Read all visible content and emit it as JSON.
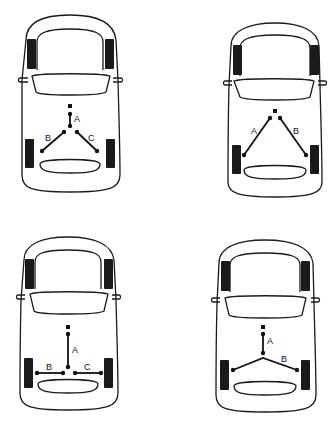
{
  "diagram": {
    "title": "",
    "colors": {
      "line": "#1a1a1a",
      "background": "#ffffff"
    },
    "cars": [
      {
        "id": "car-1",
        "position": "top-left",
        "layout": "Y-split: lever to three-way split, two diagonal cables to rear wheels",
        "labels": {
          "a": "A",
          "b": "B",
          "c": "C"
        }
      },
      {
        "id": "car-2",
        "position": "top-right",
        "layout": "V-split: two diagonal cables from lever to rear wheels",
        "labels": {
          "a": "A",
          "b": "B"
        }
      },
      {
        "id": "car-3",
        "position": "bottom-left",
        "layout": "T-split: vertical cable to equalizer, two horizontal cables to rear wheels",
        "labels": {
          "a": "A",
          "b": "B",
          "c": "C"
        }
      },
      {
        "id": "car-4",
        "position": "bottom-right",
        "layout": "Single front cable to equalizer, one continuous rear cable across both wheels",
        "labels": {
          "a": "A",
          "b": "B"
        }
      }
    ]
  }
}
